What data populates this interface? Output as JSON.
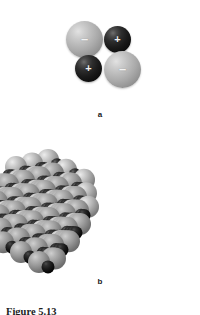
{
  "figure": {
    "background_color": "#ffffff",
    "width": 200,
    "height": 315,
    "caption_text": "Figure 5.13",
    "caption_visible_fraction": "top edge only (clipped by image border)"
  },
  "panel_a": {
    "label": "a",
    "description": "Four ions arranged in a square: two large light-gray anions and two small dark cations, alternating.",
    "ions": [
      {
        "id": "anion-top-left",
        "charge_sign": "−",
        "charge": "negative",
        "species": "anion",
        "size": "large",
        "color": "#b0b0b0",
        "position": "top-left"
      },
      {
        "id": "cation-top-right",
        "charge_sign": "+",
        "charge": "positive",
        "species": "cation",
        "size": "small",
        "color": "#151515",
        "position": "top-right"
      },
      {
        "id": "cation-bottom-left",
        "charge_sign": "+",
        "charge": "positive",
        "species": "cation",
        "size": "small",
        "color": "#151515",
        "position": "bottom-left"
      },
      {
        "id": "anion-bottom-right",
        "charge_sign": "−",
        "charge": "negative",
        "species": "anion",
        "size": "large",
        "color": "#b0b0b0",
        "position": "bottom-right"
      }
    ],
    "sign_text_color": "#f2f2f2"
  },
  "panel_b": {
    "label": "b",
    "description": "Space-filling model of an ionic crystal lattice: alternating large light-gray anions and small dark cations in a rhombohedral block.",
    "anion_color": "#b4b4b4",
    "cation_color": "#161616",
    "lattice": {
      "type": "rock-salt-block",
      "columns": 9,
      "rows": 7,
      "layers": 4,
      "anion_radius_px": 11,
      "cation_radius_px": 6.5,
      "step_x_px": 18,
      "step_y_px": 9,
      "depth_dx_px": -8,
      "depth_dy_px": 14
    }
  }
}
